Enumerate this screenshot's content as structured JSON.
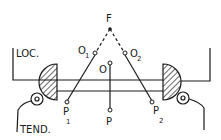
{
  "diagram": {
    "labels": {
      "focus": "F",
      "center": "O",
      "o1": "O",
      "o1_sub": "1",
      "o2": "O",
      "o2_sub": "2",
      "p": "P",
      "p1": "P",
      "p1_sub": "1",
      "p2": "P",
      "p2_sub": "2",
      "locomotive": "LOC.",
      "tender": "TEND."
    },
    "colors": {
      "ink": "#1a1a1a",
      "background": "#ffffff"
    }
  }
}
